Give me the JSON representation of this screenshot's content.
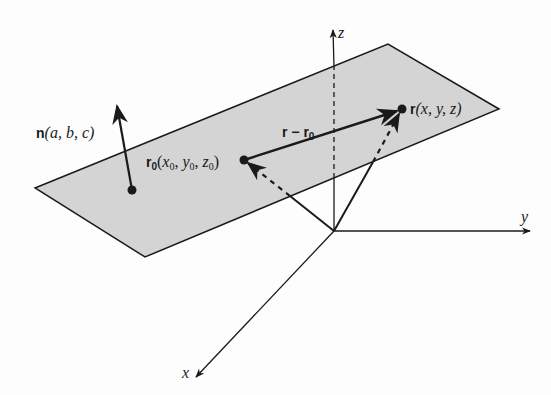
{
  "diagram": {
    "colors": {
      "plane_fill": "#d4d4d4",
      "stroke": "#1a1a1a",
      "background": "#fdfdfd"
    },
    "plane": {
      "corners": [
        [
          35,
          188
        ],
        [
          388,
          44
        ],
        [
          499,
          109
        ],
        [
          145,
          257
        ]
      ]
    },
    "axes": {
      "origin": [
        334,
        231
      ],
      "x": {
        "label": "x",
        "tip": [
          196,
          377
        ]
      },
      "y": {
        "label": "y",
        "tip": [
          530,
          231
        ]
      },
      "z": {
        "label": "z",
        "tip": [
          333,
          30
        ]
      }
    },
    "points": {
      "normal_base": {
        "pos": [
          132,
          190
        ]
      },
      "r0": {
        "pos": [
          244,
          160
        ],
        "label_bold": "r",
        "label_bold_sub": "0",
        "label_rest_open": "(",
        "coords": [
          "x",
          "y",
          "z"
        ],
        "coord_sub": "0"
      },
      "r": {
        "pos": [
          402,
          109
        ],
        "label_bold": "r",
        "label_rest": "(x, y, z)"
      }
    },
    "vectors": {
      "normal": {
        "label_bold": "n",
        "label_rest": "(a, b, c)",
        "from": [
          132,
          190
        ],
        "to": [
          117,
          106
        ]
      },
      "difference": {
        "label": "r − r",
        "label_sub": "0",
        "from": [
          244,
          160
        ],
        "to": [
          402,
          109
        ]
      }
    }
  }
}
